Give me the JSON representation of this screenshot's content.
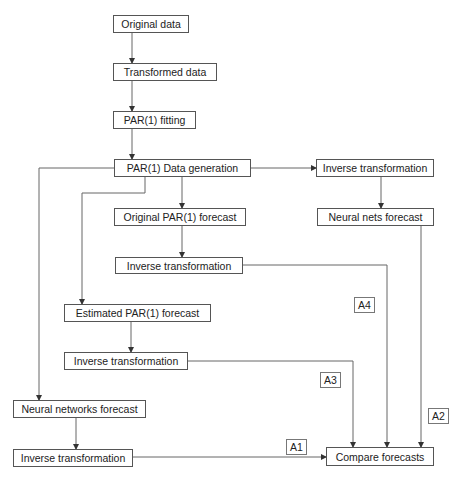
{
  "nodes": {
    "original_data": "Original data",
    "transformed_data": "Transformed data",
    "par1_fitting": "PAR(1) fitting",
    "par1_data_generation": "PAR(1) Data generation",
    "inverse_transformation_right": "Inverse transformation",
    "neural_nets_forecast": "Neural nets forecast",
    "original_par1_forecast": "Original PAR(1) forecast",
    "inverse_transformation_original": "Inverse transformation",
    "estimated_par1_forecast": "Estimated PAR(1) forecast",
    "inverse_transformation_estimated": "Inverse transformation",
    "neural_networks_forecast": "Neural networks forecast",
    "inverse_transformation_neural": "Inverse transformation",
    "compare_forecasts": "Compare forecasts"
  },
  "labels": {
    "a1": "A1",
    "a2": "A2",
    "a3": "A3",
    "a4": "A4"
  },
  "colors": {
    "line": "#555555",
    "border": "#555555",
    "text": "#222222"
  }
}
